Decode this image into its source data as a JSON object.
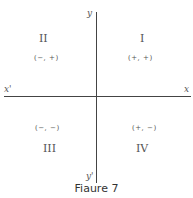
{
  "axes": {
    "x_label": "x",
    "x_prime_label": "x'",
    "y_label": "y",
    "y_prime_label": "y'"
  },
  "quadrants": [
    {
      "numeral": "I",
      "signs": "(+, +)"
    },
    {
      "numeral": "II",
      "signs": "(−, +)"
    },
    {
      "numeral": "III",
      "signs": "(−, −)"
    },
    {
      "numeral": "IV",
      "signs": "(+, −)"
    }
  ],
  "caption": "Fiaure 7"
}
